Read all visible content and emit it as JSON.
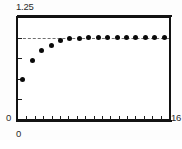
{
  "figure": {
    "background_color": "#ffffff",
    "frame_color": "#131313",
    "marker_color": "#0a0a0a",
    "reference_line_color": "#6f6f6f"
  },
  "axis_labels": {
    "y_max": "1.25",
    "y_min": "0",
    "x_min": "0",
    "x_max": "16"
  },
  "chart_data": {
    "type": "scatter",
    "title": "",
    "xlabel": "",
    "ylabel": "",
    "xlim": [
      0,
      16
    ],
    "ylim": [
      0,
      1.25
    ],
    "grid": false,
    "legend": null,
    "xtick_labels": [
      "0",
      "16"
    ],
    "ytick_labels": [
      "0",
      "1.25"
    ],
    "x_tick_count": 17,
    "y_tick_count": 5,
    "annotations": [
      {
        "kind": "horizontal-dashed-reference-line",
        "y": 1.0,
        "style": "dashed",
        "label": ""
      }
    ],
    "x": [
      0.5,
      1.5,
      2.5,
      3.5,
      4.5,
      5.5,
      6.5,
      7.5,
      8.5,
      9.5,
      10.5,
      11.5,
      12.5,
      13.5,
      14.5,
      15.5
    ],
    "y": [
      0.49,
      0.72,
      0.84,
      0.91,
      0.96,
      0.985,
      0.995,
      1.0,
      1.0,
      1.0,
      1.0,
      1.0,
      1.0,
      1.0,
      1.0,
      1.0
    ],
    "series": [
      {
        "name": "data",
        "marker": "filled-circle",
        "values": [
          0.49,
          0.72,
          0.84,
          0.91,
          0.96,
          0.985,
          0.995,
          1.0,
          1.0,
          1.0,
          1.0,
          1.0,
          1.0,
          1.0,
          1.0,
          1.0
        ]
      }
    ]
  }
}
